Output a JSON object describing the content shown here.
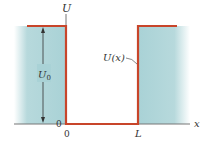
{
  "diagram": {
    "labels": {
      "y_axis": "U",
      "x_axis": "x",
      "origin_y": "0",
      "origin_x": "0",
      "well_width": "L",
      "depth": "U",
      "depth_sub": "0",
      "curve_func": "U(x)"
    },
    "colors": {
      "potential_line": "#c8452a",
      "barrier_fill": "#a9d2d6",
      "axis": "#777777",
      "text": "#333333"
    }
  }
}
